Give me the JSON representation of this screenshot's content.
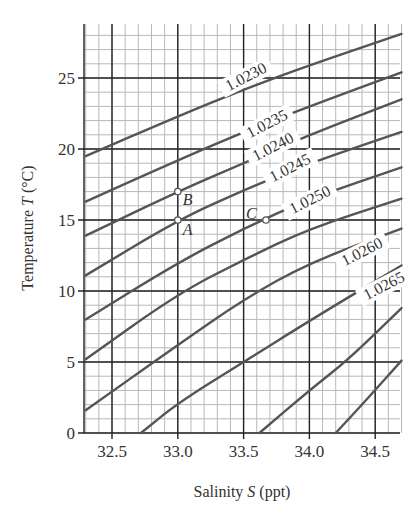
{
  "chart_data": {
    "type": "line",
    "title": "",
    "xlabel": "Salinity S (ppt)",
    "ylabel": "Temperature T (°C)",
    "xlim": [
      32.3,
      34.7
    ],
    "ylim": [
      0,
      28
    ],
    "grid": true,
    "x_ticks": [
      "32.5",
      "33.0",
      "33.5",
      "34.0",
      "34.5"
    ],
    "y_ticks": [
      "0",
      "5",
      "10",
      "15",
      "20",
      "25"
    ],
    "series": [
      {
        "name": "1.0230",
        "label": "1.0230",
        "points": [
          [
            32.3,
            19.5
          ],
          [
            33.0,
            22.3
          ],
          [
            33.5,
            24.2
          ],
          [
            34.0,
            25.9
          ],
          [
            34.7,
            28.1
          ]
        ]
      },
      {
        "name": "1.0235",
        "label": "1.0235",
        "points": [
          [
            32.3,
            16.3
          ],
          [
            33.0,
            19.2
          ],
          [
            33.5,
            21.2
          ],
          [
            34.0,
            23.0
          ],
          [
            34.7,
            25.4
          ]
        ]
      },
      {
        "name": "1.0240",
        "label": "1.0240",
        "points": [
          [
            32.3,
            13.9
          ],
          [
            33.0,
            17.0
          ],
          [
            33.5,
            19.0
          ],
          [
            34.0,
            21.0
          ],
          [
            34.7,
            23.5
          ]
        ]
      },
      {
        "name": "1.0245",
        "label": "1.0245",
        "points": [
          [
            32.3,
            11.1
          ],
          [
            33.0,
            15.0
          ],
          [
            33.5,
            17.1
          ],
          [
            34.0,
            19.0
          ],
          [
            34.7,
            21.2
          ]
        ]
      },
      {
        "name": "1.0250",
        "label": "1.0250",
        "points": [
          [
            32.3,
            8.0
          ],
          [
            33.0,
            12.0
          ],
          [
            33.5,
            14.4
          ],
          [
            34.0,
            16.5
          ],
          [
            34.7,
            18.7
          ]
        ]
      },
      {
        "name": "1.0255",
        "label": "",
        "points": [
          [
            32.3,
            5.2
          ],
          [
            33.0,
            9.8
          ],
          [
            33.5,
            12.2
          ],
          [
            34.0,
            14.4
          ],
          [
            34.7,
            16.5
          ]
        ]
      },
      {
        "name": "1.0260",
        "label": "1.0260",
        "points": [
          [
            32.3,
            1.6
          ],
          [
            33.0,
            6.2
          ],
          [
            33.5,
            9.4
          ],
          [
            34.0,
            12.0
          ],
          [
            34.7,
            14.4
          ]
        ]
      },
      {
        "name": "1.0265",
        "label": "1.0265",
        "points": [
          [
            32.72,
            0
          ],
          [
            33.0,
            2.1
          ],
          [
            33.5,
            5.0
          ],
          [
            34.0,
            7.9
          ],
          [
            34.7,
            11.8
          ]
        ]
      },
      {
        "name": "1.0270",
        "label": "",
        "points": [
          [
            33.62,
            0
          ],
          [
            34.0,
            3.0
          ],
          [
            34.3,
            5.2
          ],
          [
            34.7,
            8.8
          ]
        ]
      },
      {
        "name": "1.0275",
        "label": "",
        "points": [
          [
            34.2,
            0
          ],
          [
            34.45,
            2.5
          ],
          [
            34.7,
            5.1
          ]
        ]
      }
    ],
    "annotations": [
      {
        "label": "A",
        "S": 33.0,
        "T": 15.0
      },
      {
        "label": "B",
        "S": 33.0,
        "T": 17.0
      },
      {
        "label": "C",
        "S": 33.67,
        "T": 15.0
      }
    ],
    "colors": {
      "curve": "#555555",
      "major_grid": "#222222",
      "minor_grid": "#b8b8b8",
      "point": "#777777"
    }
  },
  "axes": {
    "xlabel_prefix": "Salinity ",
    "xlabel_var": "S",
    "xlabel_suffix": " (ppt)",
    "ylabel_prefix": "Temperature ",
    "ylabel_var": "T",
    "ylabel_suffix": " (°C)"
  }
}
